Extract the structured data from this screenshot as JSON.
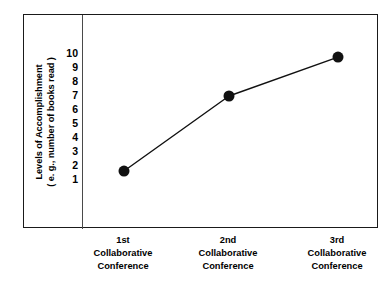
{
  "chart_data": {
    "type": "line",
    "title": "",
    "subtitle": "",
    "xlabel": "",
    "ylabel": "Levels of Accomplishment ( e. g., number of books read )",
    "ylabel_lines": [
      "Levels of Accomplishment",
      "( e. g., number of books read )"
    ],
    "categories": [
      "1st Collaborative Conference",
      "2nd Collaborative Conference",
      "3rd Collaborative Conference"
    ],
    "category_lines": [
      [
        "1st",
        "Collaborative",
        "Conference"
      ],
      [
        "2nd",
        "Collaborative",
        "Conference"
      ],
      [
        "3rd",
        "Collaborative",
        "Conference"
      ]
    ],
    "values": [
      0.5,
      5.9,
      8.7
    ],
    "series": [
      {
        "name": "Levels of Accomplishment",
        "values": [
          0.5,
          5.9,
          8.7
        ]
      }
    ],
    "y_tick_labels": [
      "10",
      "9",
      "8",
      "7",
      "6",
      "5",
      "4",
      "3",
      "2",
      "1"
    ],
    "y_tick_values": [
      10,
      9,
      8,
      7,
      6,
      5,
      4,
      3,
      2,
      1
    ],
    "ylim": [
      0,
      10.5
    ],
    "xlim": [
      0,
      4
    ],
    "grid": false,
    "legend": false,
    "legend_position": "none",
    "marker": "filled-circle",
    "marker_size": 11,
    "line_color": "#111111",
    "marker_color": "#111111",
    "line_width": 1.4,
    "frame": true,
    "frame_color": "#1a1a1a",
    "background": "#ffffff",
    "text_color": "#000000"
  },
  "figure": {
    "frame_label": "chart frame",
    "plot_label": "plot area",
    "divider_label": "axis divider"
  }
}
